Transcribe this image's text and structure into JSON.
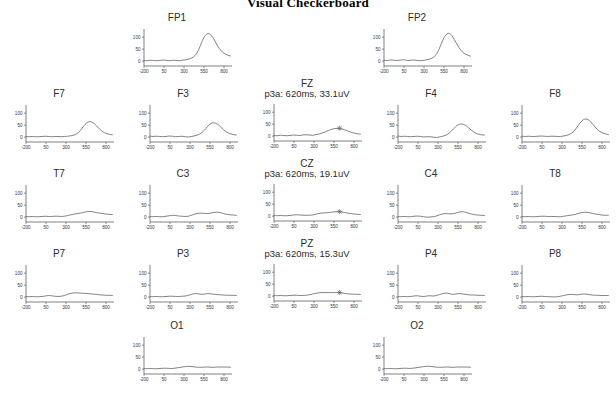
{
  "figure": {
    "title": "Visual Checkerboard"
  },
  "axes": {
    "y_ticks": [
      "0",
      "50",
      "100"
    ],
    "y_tick_values": [
      0,
      50,
      100
    ],
    "x_ticks": [
      "-200",
      "50",
      "300",
      "550",
      "800"
    ],
    "x_tick_values": [
      -200,
      50,
      300,
      550,
      800
    ],
    "xlim": [
      -200,
      900
    ],
    "ylim": [
      -20,
      130
    ],
    "xlabel": "",
    "ylabel": ""
  },
  "marker": {
    "glyph": "p3a-crosshair-marker"
  },
  "chart_data": {
    "type": "line",
    "title": "Visual Checkerboard",
    "xlabel": "Time (ms)",
    "ylabel": "Amplitude (uV)",
    "xlim": [
      -200,
      900
    ],
    "ylim": [
      -20,
      130
    ],
    "grid": false,
    "legend": "none",
    "x_tick_labels": [
      "-200",
      "50",
      "300",
      "550",
      "800"
    ],
    "y_tick_labels": [
      "0",
      "50",
      "100"
    ],
    "layout_rows": [
      {
        "row": "frontopolar",
        "panels": [
          "FP1",
          "FP2"
        ]
      },
      {
        "row": "frontal",
        "panels": [
          "F7",
          "F3",
          "FZ",
          "F4",
          "F8"
        ]
      },
      {
        "row": "central",
        "panels": [
          "T7",
          "C3",
          "CZ",
          "C4",
          "T8"
        ]
      },
      {
        "row": "parietal",
        "panels": [
          "P7",
          "P3",
          "PZ",
          "P4",
          "P8"
        ]
      },
      {
        "row": "occipital",
        "panels": [
          "O1",
          "O2"
        ]
      }
    ],
    "x": [
      -200,
      -160,
      -120,
      -80,
      -40,
      0,
      40,
      80,
      120,
      160,
      200,
      240,
      280,
      320,
      360,
      400,
      440,
      480,
      520,
      560,
      600,
      640,
      680,
      720,
      760,
      800,
      840,
      880
    ],
    "series": [
      {
        "name": "FP1",
        "label": "FP1",
        "annotation": null,
        "values": [
          3,
          2,
          4,
          3,
          2,
          3,
          5,
          3,
          2,
          4,
          3,
          2,
          4,
          6,
          9,
          14,
          24,
          45,
          78,
          104,
          115,
          108,
          88,
          64,
          45,
          33,
          26,
          22
        ]
      },
      {
        "name": "FP2",
        "label": "FP2",
        "annotation": null,
        "values": [
          4,
          3,
          5,
          4,
          3,
          4,
          6,
          4,
          3,
          5,
          4,
          2,
          3,
          5,
          8,
          13,
          23,
          44,
          76,
          103,
          116,
          110,
          90,
          66,
          46,
          33,
          26,
          21
        ]
      },
      {
        "name": "F7",
        "label": "F7",
        "annotation": null,
        "values": [
          3,
          2,
          3,
          2,
          2,
          3,
          4,
          3,
          2,
          3,
          3,
          2,
          3,
          4,
          6,
          9,
          15,
          28,
          46,
          60,
          65,
          60,
          48,
          34,
          23,
          16,
          12,
          10
        ]
      },
      {
        "name": "F3",
        "label": "F3",
        "annotation": null,
        "values": [
          4,
          3,
          4,
          3,
          2,
          3,
          5,
          4,
          2,
          3,
          4,
          2,
          1,
          3,
          6,
          10,
          17,
          29,
          45,
          57,
          60,
          55,
          44,
          31,
          21,
          15,
          11,
          9
        ]
      },
      {
        "name": "FZ",
        "label": "FZ",
        "annotation": "p3a: 620ms, 33.1uV",
        "p3a_latency_ms": 620,
        "p3a_amplitude_uv": 33.1,
        "values": [
          3,
          2,
          4,
          3,
          2,
          3,
          5,
          4,
          3,
          5,
          6,
          5,
          4,
          6,
          9,
          13,
          18,
          24,
          29,
          32,
          33,
          31,
          27,
          22,
          17,
          13,
          10,
          8
        ]
      },
      {
        "name": "F4",
        "label": "F4",
        "annotation": null,
        "values": [
          5,
          3,
          4,
          3,
          2,
          3,
          4,
          3,
          1,
          2,
          2,
          0,
          -1,
          1,
          4,
          9,
          17,
          30,
          44,
          53,
          55,
          50,
          40,
          28,
          19,
          13,
          10,
          9
        ]
      },
      {
        "name": "F8",
        "label": "F8",
        "annotation": null,
        "values": [
          4,
          3,
          4,
          3,
          3,
          4,
          5,
          4,
          3,
          4,
          4,
          3,
          3,
          5,
          8,
          13,
          22,
          38,
          57,
          71,
          76,
          70,
          56,
          40,
          27,
          19,
          14,
          11
        ]
      },
      {
        "name": "T7",
        "label": "T7",
        "annotation": null,
        "values": [
          3,
          2,
          3,
          2,
          2,
          3,
          4,
          3,
          3,
          4,
          4,
          3,
          4,
          7,
          10,
          13,
          15,
          17,
          20,
          23,
          24,
          22,
          19,
          17,
          15,
          13,
          12,
          11
        ]
      },
      {
        "name": "C3",
        "label": "C3",
        "annotation": null,
        "values": [
          3,
          2,
          3,
          2,
          2,
          4,
          6,
          8,
          7,
          5,
          4,
          3,
          4,
          8,
          13,
          16,
          17,
          16,
          15,
          17,
          20,
          21,
          19,
          15,
          12,
          10,
          9,
          8
        ]
      },
      {
        "name": "CZ",
        "label": "CZ",
        "annotation": "p3a: 620ms, 19.1uV",
        "p3a_latency_ms": 620,
        "p3a_amplitude_uv": 19.1,
        "values": [
          3,
          2,
          3,
          2,
          2,
          3,
          5,
          6,
          5,
          4,
          4,
          4,
          5,
          8,
          11,
          13,
          14,
          15,
          17,
          18,
          19,
          18,
          16,
          13,
          11,
          9,
          8,
          7
        ]
      },
      {
        "name": "C4",
        "label": "C4",
        "annotation": null,
        "values": [
          3,
          2,
          3,
          2,
          2,
          4,
          5,
          4,
          2,
          0,
          1,
          2,
          5,
          10,
          14,
          15,
          14,
          14,
          17,
          21,
          23,
          21,
          17,
          13,
          10,
          9,
          8,
          7
        ]
      },
      {
        "name": "T8",
        "label": "T8",
        "annotation": null,
        "values": [
          3,
          2,
          3,
          2,
          2,
          3,
          4,
          4,
          3,
          3,
          3,
          2,
          2,
          4,
          6,
          8,
          10,
          13,
          17,
          20,
          21,
          19,
          16,
          13,
          11,
          9,
          8,
          8
        ]
      },
      {
        "name": "P7",
        "label": "P7",
        "annotation": null,
        "values": [
          3,
          2,
          3,
          2,
          2,
          3,
          5,
          7,
          6,
          4,
          3,
          4,
          7,
          12,
          16,
          18,
          18,
          17,
          16,
          15,
          14,
          13,
          12,
          10,
          9,
          8,
          8,
          7
        ]
      },
      {
        "name": "P3",
        "label": "P3",
        "annotation": null,
        "values": [
          3,
          2,
          3,
          2,
          2,
          3,
          4,
          4,
          3,
          3,
          4,
          5,
          8,
          12,
          15,
          14,
          12,
          13,
          15,
          14,
          12,
          11,
          10,
          9,
          8,
          8,
          8,
          7
        ]
      },
      {
        "name": "PZ",
        "label": "PZ",
        "annotation": "p3a: 620ms, 15.3uV",
        "p3a_latency_ms": 620,
        "p3a_amplitude_uv": 15.3,
        "values": [
          3,
          2,
          3,
          2,
          2,
          3,
          4,
          4,
          3,
          3,
          4,
          6,
          9,
          12,
          14,
          15,
          15,
          15,
          15,
          15,
          15,
          14,
          12,
          10,
          9,
          8,
          8,
          7
        ]
      },
      {
        "name": "P4",
        "label": "P4",
        "annotation": null,
        "values": [
          3,
          2,
          3,
          2,
          3,
          5,
          6,
          4,
          3,
          5,
          6,
          5,
          7,
          11,
          15,
          17,
          15,
          12,
          13,
          15,
          14,
          12,
          10,
          9,
          9,
          8,
          8,
          7
        ]
      },
      {
        "name": "P8",
        "label": "P8",
        "annotation": null,
        "values": [
          3,
          2,
          3,
          2,
          2,
          3,
          4,
          3,
          2,
          2,
          1,
          2,
          4,
          7,
          10,
          12,
          11,
          10,
          11,
          13,
          13,
          11,
          9,
          8,
          8,
          7,
          7,
          7
        ]
      },
      {
        "name": "O1",
        "label": "O1",
        "annotation": null,
        "values": [
          3,
          2,
          3,
          2,
          2,
          3,
          4,
          4,
          3,
          3,
          5,
          7,
          9,
          11,
          12,
          11,
          9,
          8,
          8,
          9,
          9,
          8,
          8,
          9,
          9,
          9,
          9,
          8
        ]
      },
      {
        "name": "O2",
        "label": "O2",
        "annotation": null,
        "values": [
          3,
          2,
          3,
          2,
          2,
          3,
          4,
          4,
          3,
          4,
          6,
          8,
          10,
          12,
          12,
          11,
          9,
          8,
          8,
          9,
          9,
          8,
          8,
          9,
          9,
          9,
          9,
          8
        ]
      }
    ]
  }
}
